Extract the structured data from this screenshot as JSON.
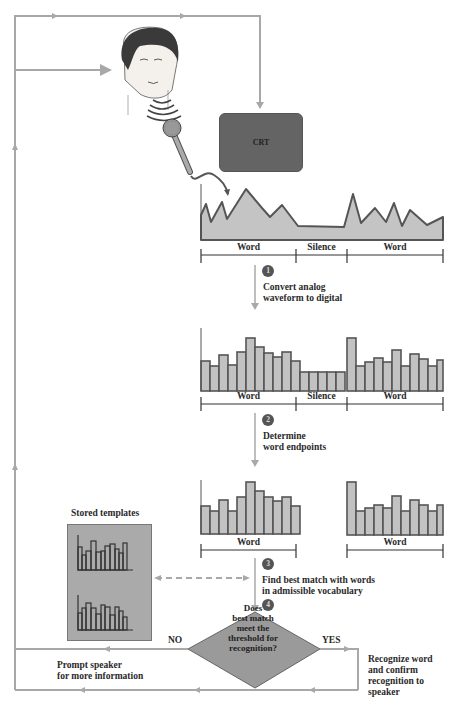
{
  "diagram": {
    "crt_label": "CRT",
    "stages": {
      "analog": {
        "segments": [
          "Word",
          "Silence",
          "Word"
        ]
      },
      "digital": {
        "segments": [
          "Word",
          "Silence",
          "Word"
        ]
      },
      "endpoints": {
        "segments": [
          "Word",
          "Word"
        ]
      }
    },
    "steps": [
      {
        "number": "1",
        "line1": "Convert analog",
        "line2": "waveform to digital"
      },
      {
        "number": "2",
        "line1": "Determine",
        "line2": "word endpoints"
      },
      {
        "number": "3",
        "line1": "Find best match with words",
        "line2": "in admissible vocabulary"
      },
      {
        "number": "4"
      }
    ],
    "stored_templates_label": "Stored templates",
    "decision": {
      "line1": "Does",
      "line2": "best match",
      "line3": "meet the",
      "line4": "threshold for",
      "line5": "recognition?",
      "no_label": "NO",
      "yes_label": "YES"
    },
    "no_action": {
      "line1": "Prompt speaker",
      "line2": "for more information"
    },
    "yes_action": {
      "line1": "Recognize word",
      "line2": "and confirm",
      "line3": "recognition to",
      "line4": "speaker"
    },
    "colors": {
      "flow_line": "#a8a8a8",
      "bar_fill": "#c2c2c2",
      "bar_stroke": "#555555",
      "crt": "#646464",
      "diamond": "#9a9a9a",
      "template_box": "#aaaaaa"
    }
  }
}
